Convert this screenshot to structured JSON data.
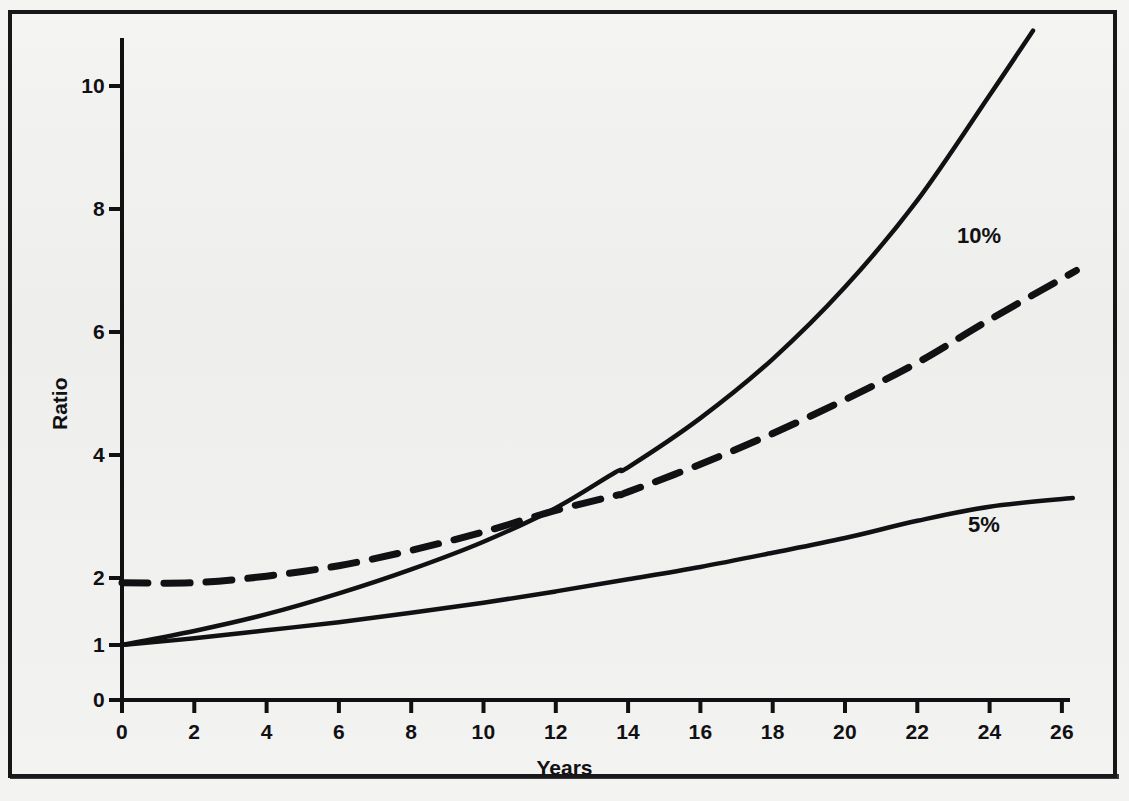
{
  "figure": {
    "background_color": "#f2f2f0",
    "ink_color": "#111114",
    "border_color": "#17171a"
  },
  "chart_data": {
    "type": "line",
    "title": "",
    "subtitle": "",
    "xlabel": "Years",
    "ylabel": "Ratio",
    "xlim": [
      0,
      26.6
    ],
    "ylim": [
      0,
      11.0
    ],
    "grid": false,
    "legend_position": "inline-annotations",
    "xticks": [
      0,
      2,
      4,
      6,
      8,
      10,
      12,
      14,
      16,
      18,
      20,
      22,
      24,
      26
    ],
    "xtick_labels": [
      "0",
      "2",
      "4",
      "6",
      "8",
      "10",
      "12",
      "14",
      "16",
      "18",
      "20",
      "22",
      "24",
      "26"
    ],
    "yticks": [
      0,
      1,
      2,
      4,
      6,
      8,
      10
    ],
    "ytick_labels": [
      "0",
      "1",
      "2",
      "4",
      "6",
      "8",
      "10"
    ],
    "annotations": [
      {
        "text": "10%",
        "x": 23.1,
        "y": 7.55
      },
      {
        "text": "5%",
        "x": 23.4,
        "y": 2.85
      }
    ],
    "series": [
      {
        "name": "10%",
        "style": "solid",
        "label": "10%",
        "x": [
          0,
          2,
          4,
          6,
          8,
          10,
          12,
          13.65,
          14,
          16,
          18,
          20,
          22,
          24,
          25.2
        ],
        "values": [
          1.0,
          1.21,
          1.46,
          1.77,
          2.14,
          2.59,
          3.14,
          3.72,
          3.8,
          4.6,
          5.56,
          6.73,
          8.14,
          9.85,
          10.9
        ]
      },
      {
        "name": "dashed",
        "style": "dashed",
        "label": "",
        "x": [
          0,
          2,
          4,
          6,
          8,
          10,
          12,
          13.65,
          14,
          16,
          18,
          20,
          22,
          24,
          26.4
        ],
        "values": [
          1.93,
          1.93,
          2.03,
          2.2,
          2.45,
          2.75,
          3.1,
          3.34,
          3.4,
          3.85,
          4.35,
          4.9,
          5.5,
          6.2,
          7.0
        ]
      },
      {
        "name": "5%",
        "style": "solid",
        "label": "5%",
        "x": [
          0,
          2,
          4,
          6,
          8,
          10,
          12,
          14,
          16,
          18,
          20,
          22,
          24,
          26.3
        ],
        "values": [
          1.0,
          1.1,
          1.22,
          1.34,
          1.48,
          1.63,
          1.8,
          1.98,
          2.18,
          2.41,
          2.65,
          2.93,
          3.16,
          3.3
        ]
      }
    ]
  }
}
